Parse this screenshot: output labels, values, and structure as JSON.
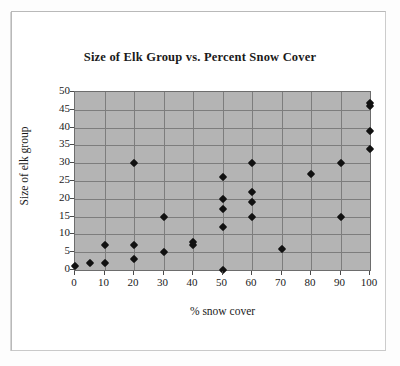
{
  "chart_data": {
    "type": "scatter",
    "title": "Size of Elk Group vs. Percent Snow Cover",
    "xlabel": "% snow cover",
    "ylabel": "Size of elk group",
    "xlim": [
      0,
      100
    ],
    "ylim": [
      0,
      50
    ],
    "xticks": [
      0,
      10,
      20,
      30,
      40,
      50,
      60,
      70,
      80,
      90,
      100
    ],
    "yticks": [
      0,
      5,
      10,
      15,
      20,
      25,
      30,
      35,
      40,
      45,
      50
    ],
    "grid": true,
    "legend": null,
    "marker": "diamond",
    "marker_color": "#111111",
    "plot_background": "#b4b4b4",
    "points": [
      {
        "x": 0,
        "y": 1
      },
      {
        "x": 5,
        "y": 2
      },
      {
        "x": 10,
        "y": 2
      },
      {
        "x": 10,
        "y": 7
      },
      {
        "x": 20,
        "y": 3
      },
      {
        "x": 20,
        "y": 7
      },
      {
        "x": 20,
        "y": 30
      },
      {
        "x": 30,
        "y": 5
      },
      {
        "x": 30,
        "y": 15
      },
      {
        "x": 40,
        "y": 7
      },
      {
        "x": 40,
        "y": 8
      },
      {
        "x": 50,
        "y": 0
      },
      {
        "x": 50,
        "y": 12
      },
      {
        "x": 50,
        "y": 17
      },
      {
        "x": 50,
        "y": 20
      },
      {
        "x": 50,
        "y": 26
      },
      {
        "x": 60,
        "y": 15
      },
      {
        "x": 60,
        "y": 19
      },
      {
        "x": 60,
        "y": 22
      },
      {
        "x": 60,
        "y": 30
      },
      {
        "x": 70,
        "y": 6
      },
      {
        "x": 80,
        "y": 27
      },
      {
        "x": 90,
        "y": 15
      },
      {
        "x": 90,
        "y": 30
      },
      {
        "x": 100,
        "y": 34
      },
      {
        "x": 100,
        "y": 39
      },
      {
        "x": 100,
        "y": 46
      },
      {
        "x": 100,
        "y": 47
      }
    ]
  }
}
